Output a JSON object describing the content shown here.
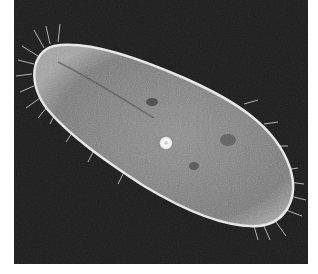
{
  "image": {
    "subject": "paramecium",
    "description": "Phase-contrast micrograph of a ciliated paramecium on a dark background",
    "colors": {
      "background_page": "#ffffff",
      "background_field": "#1c1c1c",
      "cell_body": "#8a8a8a",
      "cell_membrane": "#e8e8e8",
      "vacuole": "#f4f4f4"
    }
  }
}
